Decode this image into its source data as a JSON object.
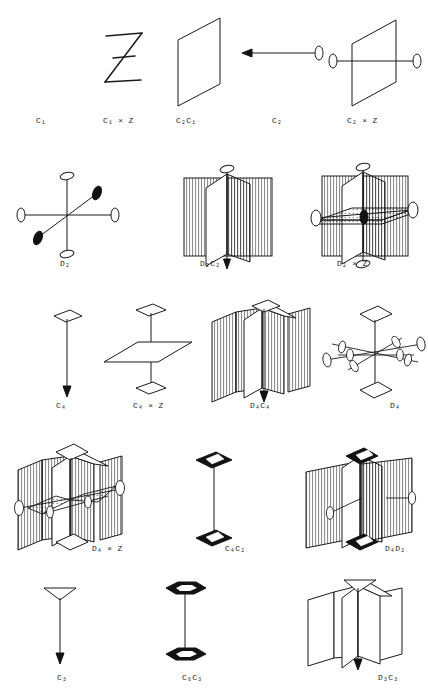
{
  "plate": {
    "title": "Point-group symmetry element diagrams",
    "background_color": "#ffffff",
    "ink_color": "#1b1b1b",
    "width": 428,
    "height": 697,
    "rows": 5,
    "figure_count": 15
  },
  "figures": [
    {
      "id": "c1",
      "label": "C",
      "sub": "1",
      "suffix": "",
      "label_text": "C₁",
      "row": 1,
      "col": 1,
      "kind": "empty",
      "x": 36,
      "y": 118
    },
    {
      "id": "c1xz",
      "label": "C",
      "sub": "1",
      "suffix": " × Z",
      "label_text": "C₁ × Z",
      "row": 1,
      "col": 2,
      "kind": "letter-z",
      "x": 103,
      "y": 118
    },
    {
      "id": "c2c1",
      "label": "C",
      "sub": "2",
      "suffix": "C₁",
      "label_text": "C₂C₁",
      "row": 1,
      "col": 3,
      "kind": "single-plane",
      "x": 176,
      "y": 118
    },
    {
      "id": "c2",
      "label": "C",
      "sub": "2",
      "suffix": "",
      "label_text": "C₂",
      "row": 1,
      "col": 4,
      "kind": "axis-arrow-lens",
      "x": 272,
      "y": 118
    },
    {
      "id": "c2xz",
      "label": "C",
      "sub": "2",
      "suffix": " × Z",
      "label_text": "C₂ × Z",
      "row": 1,
      "col": 5,
      "kind": "plane-plus-axis",
      "x": 347,
      "y": 118
    },
    {
      "id": "d2",
      "label": "D",
      "sub": "2",
      "suffix": "",
      "label_text": "D₂",
      "row": 2,
      "col": 1,
      "kind": "three-axes",
      "x": 60,
      "y": 262
    },
    {
      "id": "d2c2",
      "label": "D",
      "sub": "2",
      "suffix": "C₂",
      "label_text": "D₂C₂",
      "row": 2,
      "col": 2,
      "kind": "two-hatched",
      "x": 200,
      "y": 262
    },
    {
      "id": "d2xz",
      "label": "D",
      "sub": "2",
      "suffix": " × Z",
      "label_text": "D₂ × Z",
      "row": 2,
      "col": 3,
      "kind": "hatched-plus-horiz",
      "x": 337,
      "y": 262
    },
    {
      "id": "c4",
      "label": "C",
      "sub": "4",
      "suffix": "",
      "label_text": "C₄",
      "row": 3,
      "col": 1,
      "kind": "axis-square-arrow",
      "x": 56,
      "y": 404
    },
    {
      "id": "c4xz",
      "label": "C",
      "sub": "4",
      "suffix": " × Z",
      "label_text": "C₄ × Z",
      "row": 3,
      "col": 2,
      "kind": "axis-horiz-plane",
      "x": 133,
      "y": 404
    },
    {
      "id": "d4c4",
      "label": "D",
      "sub": "4",
      "suffix": "C₄",
      "label_text": "D₄C₄",
      "row": 3,
      "col": 3,
      "kind": "four-hatched",
      "x": 250,
      "y": 404
    },
    {
      "id": "d4",
      "label": "D",
      "sub": "4",
      "suffix": "",
      "label_text": "D₄",
      "row": 3,
      "col": 4,
      "kind": "star-axes",
      "x": 390,
      "y": 404
    },
    {
      "id": "d4xz",
      "label": "D",
      "sub": "4",
      "suffix": " × Z",
      "label_text": "D₄ × Z",
      "row": 4,
      "col": 1,
      "kind": "four-hatched-plus",
      "x": 96,
      "y": 547
    },
    {
      "id": "c4c2",
      "label": "C",
      "sub": "4",
      "suffix": "C₂",
      "label_text": "C₄C₂",
      "row": 4,
      "col": 2,
      "kind": "axis-black-square",
      "x": 225,
      "y": 547
    },
    {
      "id": "d4d2",
      "label": "D",
      "sub": "4",
      "suffix": "D₂",
      "label_text": "D₄D₂",
      "row": 4,
      "col": 3,
      "kind": "two-hatched-black",
      "x": 385,
      "y": 547
    },
    {
      "id": "c3",
      "label": "C",
      "sub": "3",
      "suffix": "",
      "label_text": "C₃",
      "row": 5,
      "col": 1,
      "kind": "axis-triangle",
      "x": 57,
      "y": 676
    },
    {
      "id": "c6c3",
      "label": "C",
      "sub": "6",
      "suffix": "C₃",
      "label_text": "C₆C₃",
      "row": 5,
      "col": 2,
      "kind": "axis-hexagon",
      "x": 182,
      "y": 676
    },
    {
      "id": "d3c3",
      "label": "D",
      "sub": "3",
      "suffix": "C₃",
      "label_text": "D₃C₃",
      "row": 5,
      "col": 3,
      "kind": "three-planes",
      "x": 378,
      "y": 676
    }
  ],
  "legend": {
    "lens_marker": "two-fold axis (lens)",
    "square_marker": "four-fold axis (square)",
    "triangle_marker": "three-fold axis (triangle)",
    "hexagon_marker": "six-fold axis (hexagon)",
    "hatched_plane": "mirror plane (hatched)",
    "plain_plane": "mirror plane (plain)"
  }
}
